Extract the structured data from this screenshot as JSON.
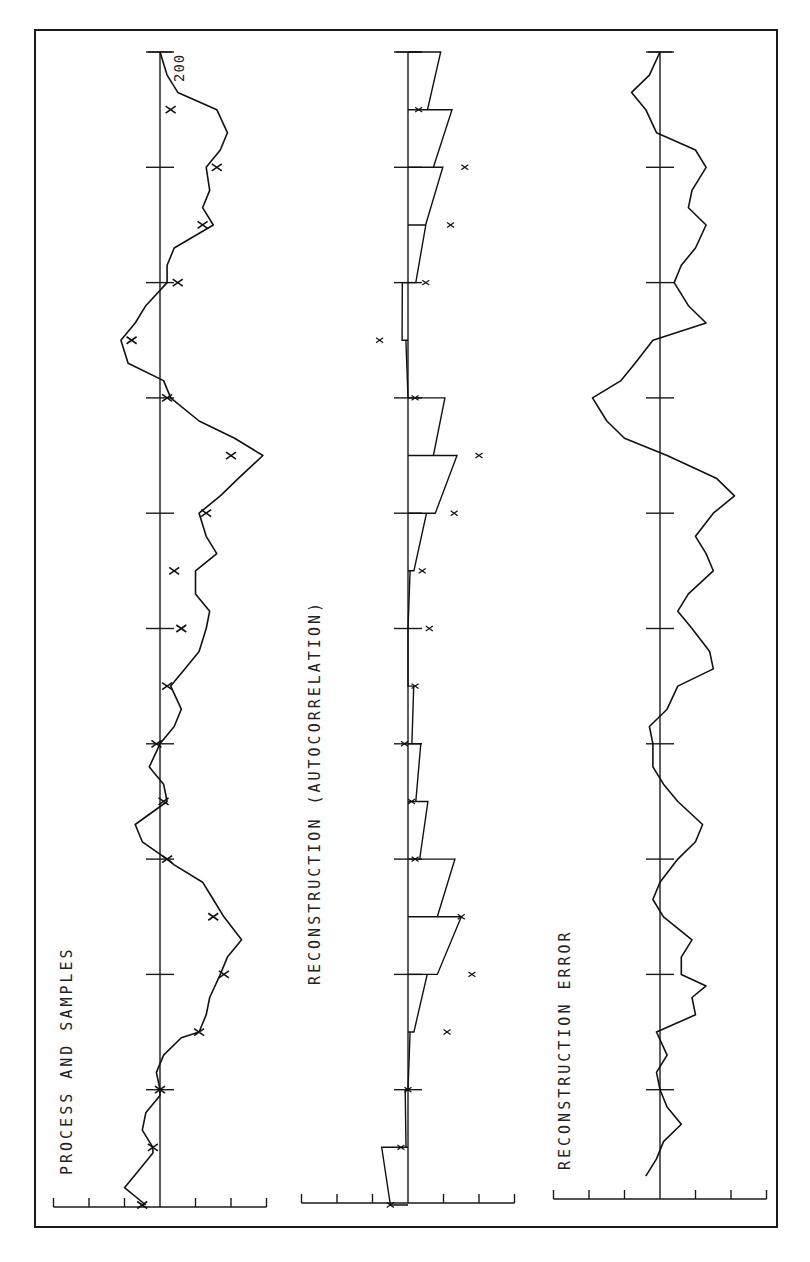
{
  "figure": {
    "orientation": "rotated-90-ccw",
    "panels": [
      {
        "id": "process",
        "title": "PROCESS AND SAMPLES"
      },
      {
        "id": "reconstruction",
        "title": "RECONSTRUCTION (AUTOCORRELATION)"
      },
      {
        "id": "error",
        "title": "RECONSTRUCTION ERROR"
      }
    ],
    "end_label": "200"
  },
  "chart_data": [
    {
      "type": "line",
      "title": "PROCESS AND SAMPLES",
      "xlabel": "time",
      "ylabel": "",
      "xlim": [
        0,
        200
      ],
      "ylim": [
        -3,
        3
      ],
      "x_ticks": [
        0,
        20,
        40,
        60,
        80,
        100,
        120,
        140,
        160,
        180,
        200
      ],
      "y_ticks": [
        -3,
        -2,
        -1,
        0,
        1,
        2,
        3
      ],
      "grid": false,
      "series": [
        {
          "name": "process",
          "x": [
            0,
            3,
            6,
            9,
            10,
            13,
            16,
            19,
            20,
            23,
            26,
            29,
            30,
            33,
            36,
            40,
            43,
            46,
            50,
            53,
            56,
            59,
            60,
            63,
            66,
            70,
            73,
            76,
            80,
            83,
            86,
            90,
            93,
            96,
            100,
            103,
            106,
            110,
            113,
            116,
            120,
            123,
            126,
            130,
            133,
            136,
            140,
            143,
            146,
            150,
            153,
            156,
            160,
            163,
            166,
            170,
            173,
            176,
            180,
            183,
            186,
            190,
            193,
            196,
            200
          ],
          "y": [
            -0.4,
            -1.0,
            -0.6,
            -0.2,
            -0.2,
            -0.5,
            -0.4,
            0.0,
            0.0,
            -0.1,
            0.1,
            0.6,
            1.1,
            1.3,
            1.4,
            1.7,
            1.9,
            2.3,
            1.8,
            1.5,
            1.2,
            0.4,
            0.2,
            -0.5,
            -0.7,
            0.2,
            0.1,
            -0.3,
            0.0,
            0.4,
            0.6,
            0.3,
            0.7,
            1.1,
            1.3,
            1.4,
            1.0,
            1.0,
            1.6,
            1.3,
            1.1,
            1.7,
            2.2,
            2.9,
            2.1,
            1.1,
            0.3,
            0.1,
            -0.9,
            -1.1,
            -0.7,
            -0.4,
            0.2,
            0.2,
            0.4,
            1.5,
            1.2,
            1.4,
            1.3,
            1.7,
            1.9,
            1.6,
            0.5,
            0.2,
            0.0
          ]
        },
        {
          "name": "samples",
          "x": [
            0,
            10,
            20,
            30,
            40,
            50,
            60,
            70,
            80,
            90,
            100,
            110,
            120,
            130,
            140,
            150,
            160,
            170,
            180,
            190
          ],
          "y": [
            -0.5,
            -0.2,
            0.0,
            1.1,
            1.8,
            1.5,
            0.2,
            0.1,
            -0.1,
            0.2,
            0.6,
            0.4,
            1.3,
            2.0,
            0.2,
            -0.8,
            0.5,
            1.2,
            1.6,
            0.3
          ]
        }
      ]
    },
    {
      "type": "line",
      "title": "RECONSTRUCTION (AUTOCORRELATION)",
      "xlabel": "time",
      "xlim": [
        0,
        200
      ],
      "ylim": [
        -3,
        3
      ],
      "x_ticks": [
        0,
        20,
        40,
        60,
        80,
        100,
        120,
        140,
        160,
        180,
        200
      ],
      "y_ticks": [
        -3,
        -2,
        -1,
        0,
        1,
        2,
        3
      ],
      "grid": false,
      "series": [
        {
          "name": "reconstruction",
          "x": [
            0,
            10,
            20,
            30,
            40,
            50,
            60,
            70,
            80,
            90,
            100,
            110,
            120,
            130,
            140,
            150,
            160,
            170,
            180,
            190,
            200
          ],
          "y": [
            -0.9,
            -0.1,
            0.0,
            0.3,
            1.5,
            1.5,
            0.6,
            0.4,
            0.2,
            0.0,
            0.0,
            0.3,
            1.4,
            1.3,
            0.0,
            -0.3,
            0.4,
            0.9,
            1.3,
            1.0,
            0.6
          ]
        },
        {
          "name": "samples",
          "x": [
            0,
            10,
            20,
            30,
            40,
            50,
            60,
            70,
            80,
            90,
            100,
            110,
            120,
            130,
            140,
            150,
            160,
            170,
            180,
            190
          ],
          "y": [
            -0.5,
            -0.2,
            0.0,
            1.1,
            1.8,
            1.5,
            0.2,
            0.1,
            -0.1,
            0.2,
            0.6,
            0.4,
            1.3,
            2.0,
            0.2,
            -0.8,
            0.5,
            1.2,
            1.6,
            0.3
          ]
        }
      ]
    },
    {
      "type": "line",
      "title": "RECONSTRUCTION ERROR",
      "xlabel": "time",
      "xlim": [
        0,
        200
      ],
      "ylim": [
        -3,
        3
      ],
      "x_ticks": [
        0,
        20,
        40,
        60,
        80,
        100,
        120,
        140,
        160,
        180,
        200
      ],
      "y_ticks": [
        -3,
        -2,
        -1,
        0,
        1,
        2,
        3
      ],
      "grid": false,
      "series": [
        {
          "name": "error",
          "x": [
            5,
            8,
            11,
            14,
            17,
            20,
            23,
            26,
            30,
            33,
            36,
            38,
            40,
            43,
            46,
            50,
            53,
            56,
            60,
            63,
            66,
            70,
            73,
            76,
            80,
            83,
            86,
            90,
            93,
            96,
            100,
            103,
            106,
            110,
            113,
            116,
            120,
            123,
            126,
            130,
            133,
            136,
            140,
            143,
            146,
            150,
            153,
            156,
            160,
            163,
            166,
            170,
            173,
            176,
            180,
            183,
            186,
            190,
            193,
            196,
            200
          ],
          "y": [
            -0.4,
            -0.1,
            0.1,
            0.6,
            0.2,
            0.0,
            -0.1,
            0.2,
            -0.1,
            1.0,
            0.9,
            1.3,
            0.6,
            0.6,
            0.9,
            0.1,
            -0.2,
            0.0,
            0.5,
            1.0,
            1.2,
            0.5,
            0.1,
            -0.2,
            -0.2,
            -0.3,
            0.2,
            0.5,
            1.5,
            1.4,
            0.9,
            0.5,
            0.8,
            1.5,
            1.3,
            1.0,
            1.5,
            2.1,
            1.6,
            0.2,
            -1.0,
            -1.5,
            -1.9,
            -1.1,
            -0.7,
            -0.2,
            1.3,
            0.8,
            0.4,
            0.6,
            1.0,
            1.3,
            0.8,
            0.9,
            1.3,
            1.0,
            -0.1,
            -0.4,
            -0.8,
            -0.3,
            0.0
          ]
        }
      ]
    }
  ]
}
